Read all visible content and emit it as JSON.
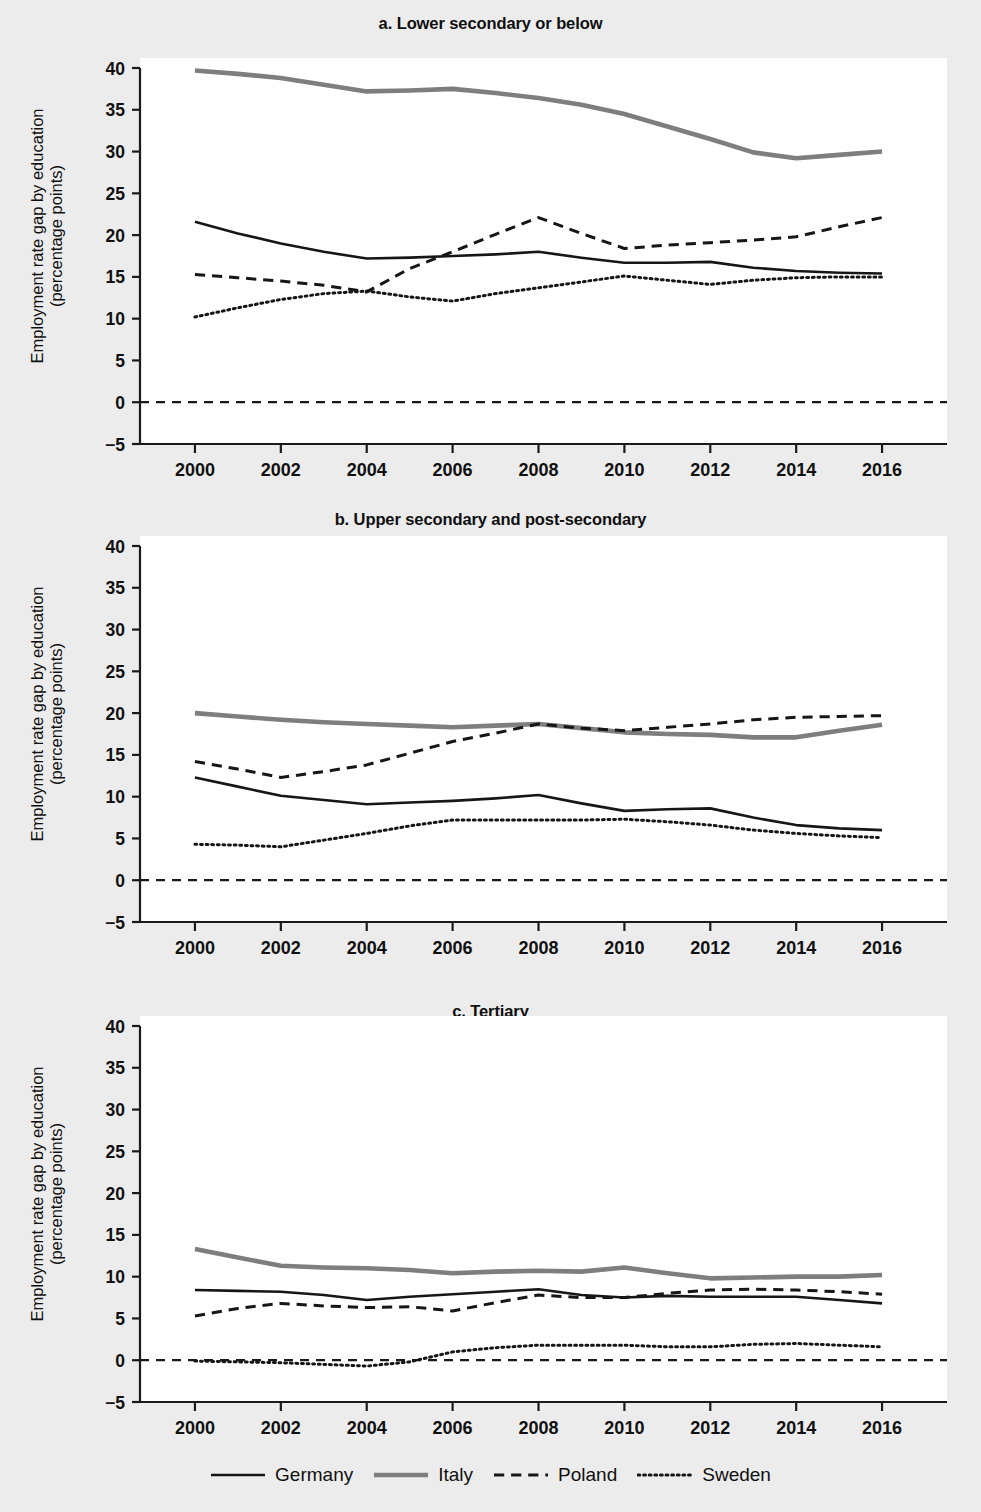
{
  "figure": {
    "background_color": "#ececed",
    "plot_background_color": "#ffffff",
    "ylabel_line1": "Employment rate gap by education",
    "ylabel_line2": "(percentage points)"
  },
  "legend": {
    "position": "bottom-center",
    "items": [
      {
        "label": "Germany",
        "style": "solid",
        "color": "#161616",
        "width": 2.6
      },
      {
        "label": "Italy",
        "style": "solid",
        "color": "#7e7e7e",
        "width": 4.6
      },
      {
        "label": "Poland",
        "style": "dashed",
        "color": "#161616",
        "width": 3.0
      },
      {
        "label": "Sweden",
        "style": "dotted",
        "color": "#161616",
        "width": 3.0
      }
    ]
  },
  "axis": {
    "y_ticks": [
      -5,
      0,
      5,
      10,
      15,
      20,
      25,
      30,
      35,
      40
    ],
    "y_tick_labels": [
      "−5",
      "0",
      "5",
      "10",
      "15",
      "20",
      "25",
      "30",
      "35",
      "40"
    ],
    "ylim": [
      -5,
      40
    ],
    "x_ticks": [
      2000,
      2002,
      2004,
      2006,
      2008,
      2010,
      2012,
      2014,
      2016
    ],
    "x_tick_labels": [
      "2000",
      "2002",
      "2004",
      "2006",
      "2008",
      "2010",
      "2012",
      "2014",
      "2016"
    ],
    "xlim": [
      1999,
      2017
    ],
    "zero_reference_line": 0,
    "grid": false
  },
  "chart_data": [
    {
      "id": "a",
      "type": "line",
      "title": "a. Lower secondary or below",
      "xlabel": "",
      "ylabel": "Employment rate gap by education (percentage points)",
      "ylim": [
        -5,
        40
      ],
      "xlim": [
        1999,
        2017
      ],
      "x": [
        2000,
        2001,
        2002,
        2003,
        2004,
        2005,
        2006,
        2007,
        2008,
        2009,
        2010,
        2011,
        2012,
        2013,
        2014,
        2015,
        2016
      ],
      "series": [
        {
          "name": "Germany",
          "style": "solid",
          "color": "#161616",
          "values": [
            21.6,
            20.2,
            19.0,
            18.0,
            17.2,
            17.3,
            17.5,
            17.7,
            18.0,
            17.3,
            16.7,
            16.7,
            16.8,
            16.1,
            15.7,
            15.5,
            15.4
          ]
        },
        {
          "name": "Italy",
          "style": "solid",
          "color": "#7e7e7e",
          "values": [
            39.7,
            39.3,
            38.8,
            38.0,
            37.2,
            37.3,
            37.5,
            37.0,
            36.4,
            35.6,
            34.5,
            33.0,
            31.5,
            29.9,
            29.2,
            29.6,
            30.0
          ]
        },
        {
          "name": "Poland",
          "style": "dashed",
          "color": "#161616",
          "values": [
            15.3,
            14.9,
            14.5,
            14.0,
            13.2,
            16.0,
            18.0,
            20.1,
            22.1,
            20.2,
            18.4,
            18.8,
            19.1,
            19.4,
            19.8,
            21.0,
            22.1
          ]
        },
        {
          "name": "Sweden",
          "style": "dotted",
          "color": "#161616",
          "values": [
            10.2,
            11.3,
            12.3,
            13.0,
            13.3,
            12.6,
            12.1,
            13.0,
            13.7,
            14.4,
            15.1,
            14.6,
            14.1,
            14.6,
            14.9,
            15.0,
            15.0
          ]
        }
      ]
    },
    {
      "id": "b",
      "type": "line",
      "title": "b. Upper secondary and post-secondary",
      "xlabel": "",
      "ylabel": "Employment rate gap by education (percentage points)",
      "ylim": [
        -5,
        40
      ],
      "xlim": [
        1999,
        2017
      ],
      "x": [
        2000,
        2001,
        2002,
        2003,
        2004,
        2005,
        2006,
        2007,
        2008,
        2009,
        2010,
        2011,
        2012,
        2013,
        2014,
        2015,
        2016
      ],
      "series": [
        {
          "name": "Germany",
          "style": "solid",
          "color": "#161616",
          "values": [
            12.3,
            11.2,
            10.1,
            9.6,
            9.1,
            9.3,
            9.5,
            9.8,
            10.2,
            9.2,
            8.3,
            8.5,
            8.6,
            7.5,
            6.6,
            6.2,
            6.0
          ]
        },
        {
          "name": "Italy",
          "style": "solid",
          "color": "#7e7e7e",
          "values": [
            20.0,
            19.6,
            19.2,
            18.9,
            18.7,
            18.5,
            18.3,
            18.5,
            18.7,
            18.2,
            17.7,
            17.5,
            17.4,
            17.1,
            17.1,
            17.9,
            18.6
          ]
        },
        {
          "name": "Poland",
          "style": "dashed",
          "color": "#161616",
          "values": [
            14.2,
            13.3,
            12.3,
            13.0,
            13.8,
            15.2,
            16.6,
            17.6,
            18.7,
            18.2,
            17.9,
            18.3,
            18.7,
            19.2,
            19.5,
            19.6,
            19.7
          ]
        },
        {
          "name": "Sweden",
          "style": "dotted",
          "color": "#161616",
          "values": [
            4.3,
            4.2,
            4.0,
            4.8,
            5.6,
            6.5,
            7.2,
            7.2,
            7.2,
            7.2,
            7.3,
            7.0,
            6.6,
            6.0,
            5.6,
            5.3,
            5.1
          ]
        }
      ]
    },
    {
      "id": "c",
      "type": "line",
      "title": "c. Tertiary",
      "xlabel": "",
      "ylabel": "Employment rate gap by education (percentage points)",
      "ylim": [
        -5,
        40
      ],
      "xlim": [
        1999,
        2017
      ],
      "x": [
        2000,
        2001,
        2002,
        2003,
        2004,
        2005,
        2006,
        2007,
        2008,
        2009,
        2010,
        2011,
        2012,
        2013,
        2014,
        2015,
        2016
      ],
      "series": [
        {
          "name": "Germany",
          "style": "solid",
          "color": "#161616",
          "values": [
            8.4,
            8.3,
            8.2,
            7.8,
            7.2,
            7.6,
            7.9,
            8.2,
            8.5,
            7.8,
            7.5,
            7.7,
            7.6,
            7.6,
            7.6,
            7.2,
            6.8
          ]
        },
        {
          "name": "Italy",
          "style": "solid",
          "color": "#7e7e7e",
          "values": [
            13.3,
            12.3,
            11.3,
            11.1,
            11.0,
            10.8,
            10.4,
            10.6,
            10.7,
            10.6,
            11.1,
            10.4,
            9.8,
            9.9,
            10.0,
            10.0,
            10.2
          ]
        },
        {
          "name": "Poland",
          "style": "dashed",
          "color": "#161616",
          "values": [
            5.3,
            6.2,
            6.8,
            6.5,
            6.3,
            6.4,
            5.9,
            6.9,
            7.8,
            7.5,
            7.5,
            8.0,
            8.4,
            8.5,
            8.4,
            8.2,
            7.9
          ]
        },
        {
          "name": "Sweden",
          "style": "dotted",
          "color": "#161616",
          "values": [
            -0.1,
            -0.2,
            -0.3,
            -0.5,
            -0.7,
            -0.2,
            1.0,
            1.5,
            1.8,
            1.8,
            1.8,
            1.6,
            1.6,
            1.9,
            2.0,
            1.8,
            1.6
          ]
        }
      ]
    }
  ]
}
